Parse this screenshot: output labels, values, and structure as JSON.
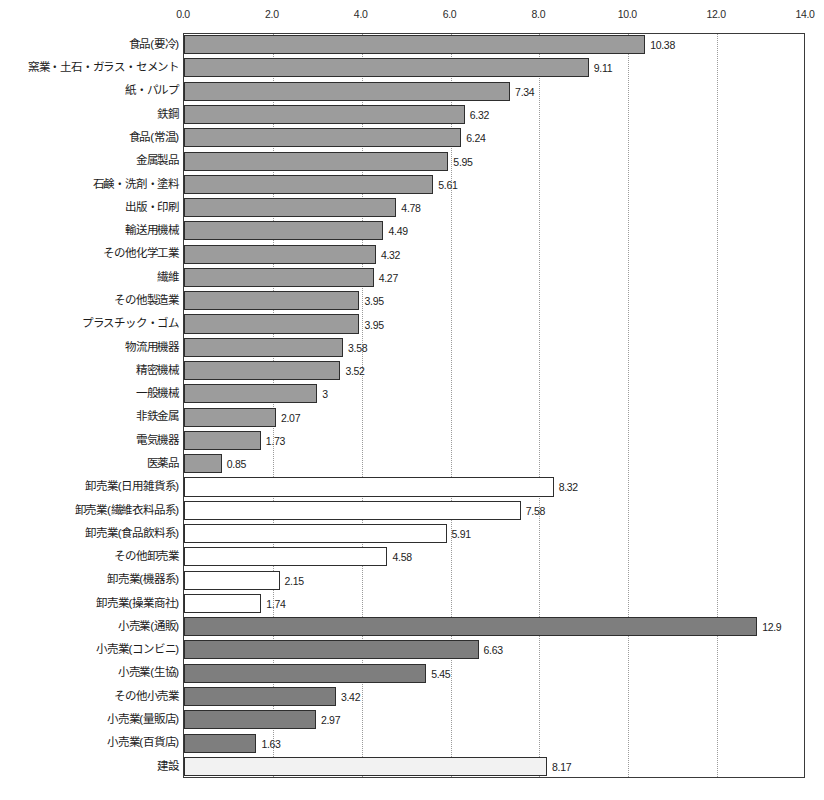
{
  "chart_data": {
    "type": "bar",
    "orientation": "horizontal",
    "title": "",
    "xlabel": "",
    "ylabel": "",
    "xlim": [
      0,
      14
    ],
    "xticks": [
      "0.0",
      "2.0",
      "4.0",
      "6.0",
      "8.0",
      "10.0",
      "12.0",
      "14.0"
    ],
    "xtick_values": [
      0,
      2,
      4,
      6,
      8,
      10,
      12,
      14
    ],
    "grid": true,
    "grid_axis": "x",
    "legend": "none",
    "categories": [
      "食品(要冷)",
      "窯業・土石・ガラス・セメント",
      "紙・パルプ",
      "鉄鋼",
      "食品(常温)",
      "金属製品",
      "石鹸・洗剤・塗料",
      "出版・印刷",
      "輸送用機械",
      "その他化学工業",
      "繊維",
      "その他製造業",
      "プラスチック・ゴム",
      "物流用機器",
      "精密機械",
      "一般機械",
      "非鉄金属",
      "電気機器",
      "医薬品",
      "卸売業(日用雑貨系)",
      "卸売業(繊維衣料品系)",
      "卸売業(食品飲料系)",
      "その他卸売業",
      "卸売業(機器系)",
      "卸売業(操業商社)",
      "小売業(通販)",
      "小売業(コンビニ)",
      "小売業(生協)",
      "その他小売業",
      "小売業(量販店)",
      "小売業(百貨店)",
      "建設"
    ],
    "values": [
      10.38,
      9.11,
      7.34,
      6.32,
      6.24,
      5.95,
      5.61,
      4.78,
      4.49,
      4.32,
      4.27,
      3.95,
      3.95,
      3.58,
      3.52,
      3,
      2.07,
      1.73,
      0.85,
      8.32,
      7.58,
      5.91,
      4.58,
      2.15,
      1.74,
      12.9,
      6.63,
      5.45,
      3.42,
      2.97,
      1.63,
      8.17
    ],
    "value_labels": [
      "10.38",
      "9.11",
      "7.34",
      "6.32",
      "6.24",
      "5.95",
      "5.61",
      "4.78",
      "4.49",
      "4.32",
      "4.27",
      "3.95",
      "3.95",
      "3.58",
      "3.52",
      "3",
      "2.07",
      "1.73",
      "0.85",
      "8.32",
      "7.58",
      "5.91",
      "4.58",
      "2.15",
      "1.74",
      "12.9",
      "6.63",
      "5.45",
      "3.42",
      "2.97",
      "1.63",
      "8.17"
    ],
    "groups": [
      "manufacturing",
      "manufacturing",
      "manufacturing",
      "manufacturing",
      "manufacturing",
      "manufacturing",
      "manufacturing",
      "manufacturing",
      "manufacturing",
      "manufacturing",
      "manufacturing",
      "manufacturing",
      "manufacturing",
      "manufacturing",
      "manufacturing",
      "manufacturing",
      "manufacturing",
      "manufacturing",
      "manufacturing",
      "wholesale",
      "wholesale",
      "wholesale",
      "wholesale",
      "wholesale",
      "wholesale",
      "retail",
      "retail",
      "retail",
      "retail",
      "retail",
      "retail",
      "construction"
    ],
    "group_colors": {
      "manufacturing": "#9c9c9c",
      "wholesale": "#ffffff",
      "retail": "#7e7e7e",
      "construction": "#f2f2f2",
      "bar_border": "#2e2e2e",
      "axis": "#3a3a3a",
      "gridline": "#9b9b9b"
    }
  }
}
